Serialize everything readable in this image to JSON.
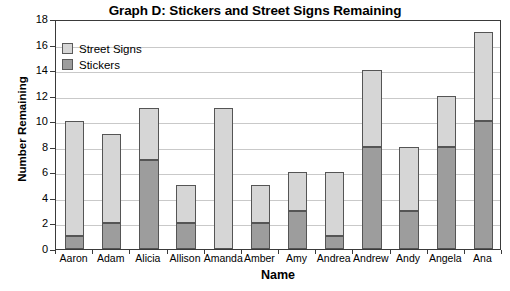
{
  "chart_data": {
    "type": "bar",
    "stacked": true,
    "title": "Graph D: Stickers and Street Signs Remaining",
    "xlabel": "Name",
    "ylabel": "Number Remaining",
    "ylim": [
      0,
      18
    ],
    "ytick_step": 2,
    "yticks": [
      0,
      2,
      4,
      6,
      8,
      10,
      12,
      14,
      16,
      18
    ],
    "grid": true,
    "grid_axis": "y",
    "legend_position": "top-left-inside",
    "categories": [
      "Aaron",
      "Adam",
      "Alicia",
      "Allison",
      "Amanda",
      "Amber",
      "Amy",
      "Andrea",
      "Andrew",
      "Andy",
      "Angela",
      "Ana"
    ],
    "series": [
      {
        "name": "Stickers",
        "color": "#9d9d9d",
        "values": [
          1,
          2,
          7,
          2,
          0,
          2,
          3,
          1,
          8,
          3,
          8,
          10
        ]
      },
      {
        "name": "Street Signs",
        "color": "#d6d6d6",
        "values": [
          9,
          7,
          4,
          3,
          11,
          3,
          3,
          5,
          6,
          5,
          4,
          7
        ]
      }
    ],
    "totals": [
      10,
      9,
      11,
      5,
      11,
      5,
      6,
      6,
      14,
      8,
      12,
      17
    ]
  },
  "legend": {
    "items": [
      {
        "label": "Street Signs",
        "swatch": "light-gray-swatch"
      },
      {
        "label": "Stickers",
        "swatch": "dark-gray-swatch"
      }
    ]
  },
  "colors": {
    "street_signs": "#d6d6d6",
    "stickers": "#9d9d9d",
    "axis": "#3a3a3a",
    "gridline": "#c9c9c9",
    "background": "#ffffff",
    "text": "#000000"
  }
}
